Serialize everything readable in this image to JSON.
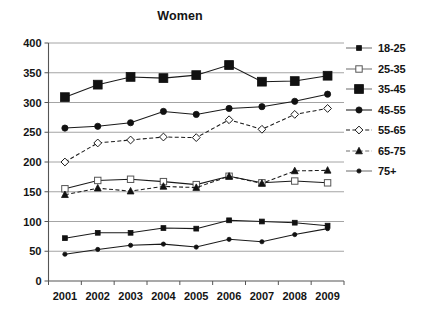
{
  "chart_data": {
    "type": "line",
    "title": "Women",
    "xlabel": "",
    "ylabel": "",
    "x": [
      "2001",
      "2002",
      "2003",
      "2004",
      "2005",
      "2006",
      "2007",
      "2008",
      "2009"
    ],
    "categories": [
      "2001",
      "2002",
      "2003",
      "2004",
      "2005",
      "2006",
      "2007",
      "2008",
      "2009"
    ],
    "ylim": [
      0,
      400
    ],
    "yticks": [
      0,
      50,
      100,
      150,
      200,
      250,
      300,
      350,
      400
    ],
    "ytick_labels": [
      "0",
      "50",
      "100",
      "150",
      "200",
      "250",
      "300",
      "350",
      "400"
    ],
    "grid": true,
    "legend_position": "right",
    "series": [
      {
        "name": "18-25",
        "marker": "small-filled-square",
        "line_style": "solid",
        "line_color": "#6f6f6f",
        "marker_color": "#111111",
        "values": [
          72,
          81,
          81,
          89,
          88,
          102,
          100,
          98,
          93
        ]
      },
      {
        "name": "25-35",
        "marker": "open-square",
        "line_style": "solid",
        "line_color": "#6f6f6f",
        "marker_color": "#ffffff",
        "values": [
          155,
          169,
          171,
          167,
          162,
          176,
          165,
          168,
          165
        ]
      },
      {
        "name": "35-45",
        "marker": "large-filled-square",
        "line_style": "solid",
        "line_color": "#6f6f6f",
        "marker_color": "#111111",
        "values": [
          309,
          330,
          343,
          341,
          346,
          363,
          335,
          336,
          345
        ]
      },
      {
        "name": "45-55",
        "marker": "filled-circle",
        "line_style": "solid",
        "line_color": "#1a1a1a",
        "marker_color": "#111111",
        "values": [
          257,
          260,
          266,
          285,
          280,
          290,
          293,
          302,
          314
        ]
      },
      {
        "name": "55-65",
        "marker": "open-diamond",
        "line_style": "dashed",
        "line_color": "#1a1a1a",
        "marker_color": "#ffffff",
        "values": [
          200,
          232,
          237,
          242,
          241,
          271,
          255,
          280,
          290
        ]
      },
      {
        "name": "65-75",
        "marker": "filled-triangle",
        "line_style": "dashed",
        "line_color": "#6f6f6f",
        "marker_color": "#111111",
        "values": [
          145,
          156,
          151,
          159,
          157,
          176,
          164,
          185,
          186
        ]
      },
      {
        "name": "75+",
        "marker": "small-filled-circle",
        "line_style": "solid",
        "line_color": "#6f6f6f",
        "marker_color": "#111111",
        "values": [
          45,
          53,
          60,
          62,
          57,
          70,
          66,
          78,
          88
        ]
      }
    ]
  },
  "legend": {
    "items": [
      {
        "label": "18-25"
      },
      {
        "label": "25-35"
      },
      {
        "label": "35-45"
      },
      {
        "label": "45-55"
      },
      {
        "label": "55-65"
      },
      {
        "label": "65-75"
      },
      {
        "label": "75+"
      }
    ]
  }
}
